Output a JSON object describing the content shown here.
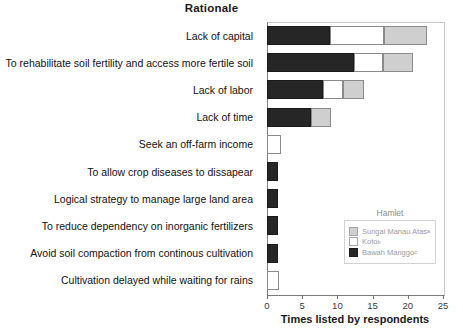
{
  "chart_data": {
    "type": "bar",
    "orientation": "horizontal",
    "stacked": true,
    "title": "Rationale",
    "xlabel": "Times listed by respondents",
    "ylabel": "",
    "xlim": [
      0,
      25
    ],
    "xticks": [
      0,
      5,
      10,
      15,
      20,
      25
    ],
    "xtick_labels": [
      "0",
      "5",
      "10",
      "15",
      "20",
      "25"
    ],
    "grid": false,
    "legend": {
      "title": "Hamlet",
      "position": "inner-lower-right",
      "entries": [
        {
          "name": "Sungai Manau Atas",
          "superscript": "a",
          "color": "#cfcfcf"
        },
        {
          "name": "Koto",
          "superscript": "b",
          "color": "#ffffff"
        },
        {
          "name": "Bawah Manggo",
          "superscript": "c",
          "color": "#262626"
        }
      ]
    },
    "categories": [
      "Lack of capital",
      "To rehabilitate soil fertility and access more fertile soil",
      "Lack of labor",
      "Lack of time",
      "Seek an off-farm income",
      "To allow crop diseases to dissapear",
      "Logical strategy to manage large land area",
      "To reduce dependency on inorganic fertilizers",
      "Avoid soil compaction from continous cultivation",
      "Cultivation delayed while waiting for rains"
    ],
    "series": [
      {
        "name": "Bawah Manggo",
        "color": "#262626",
        "values": [
          9.0,
          12.3,
          8.0,
          6.2,
          0.0,
          1.6,
          1.6,
          1.6,
          1.6,
          0.0
        ]
      },
      {
        "name": "Koto",
        "color": "#ffffff",
        "values": [
          7.6,
          4.2,
          2.8,
          0.0,
          2.0,
          0.0,
          0.0,
          0.0,
          0.0,
          1.7
        ]
      },
      {
        "name": "Sungai Manau Atas",
        "color": "#cfcfcf",
        "values": [
          6.1,
          4.3,
          3.0,
          2.9,
          0.0,
          0.0,
          0.0,
          0.0,
          0.0,
          0.0
        ]
      }
    ]
  }
}
